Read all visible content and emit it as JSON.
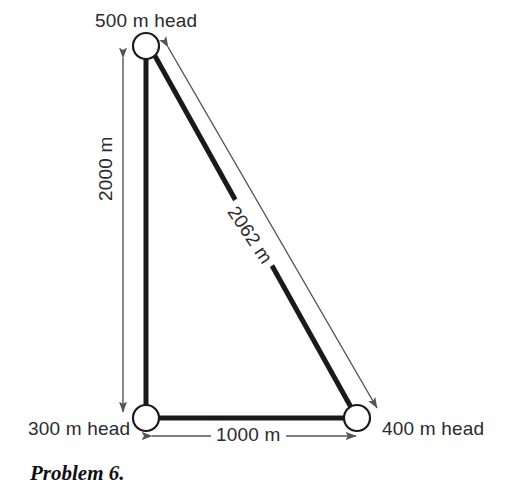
{
  "figure": {
    "title": "",
    "nodes": [
      {
        "id": "top",
        "label": "500 m head",
        "x": 146,
        "y": 46
      },
      {
        "id": "bottom-left",
        "label": "300 m head",
        "x": 146,
        "y": 418
      },
      {
        "id": "bottom-right",
        "label": "400 m head",
        "x": 357,
        "y": 418
      }
    ],
    "pipes": [
      {
        "from": "top",
        "to": "bottom-left"
      },
      {
        "from": "bottom-left",
        "to": "bottom-right"
      },
      {
        "from": "top",
        "to": "bottom-right"
      }
    ],
    "dimensions": [
      {
        "id": "vertical",
        "label": "2000 m",
        "orientation": "vertical"
      },
      {
        "id": "horizontal",
        "label": "1000 m",
        "orientation": "horizontal"
      },
      {
        "id": "diagonal",
        "label": "2062 m",
        "orientation": "diagonal"
      }
    ],
    "icons": {
      "node": "circle-node-icon",
      "arrow": "double-arrow-icon"
    },
    "colors": {
      "line": "#1a1a1a",
      "dimension_line": "#555555",
      "node_fill": "#ffffff",
      "background": "#ffffff"
    }
  },
  "caption": {
    "text": "Problem 6."
  }
}
